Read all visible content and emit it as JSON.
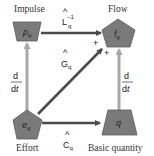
{
  "nodes": {
    "impulse": {
      "label": "Impulse",
      "symbol": "p",
      "subscript": "q",
      "shape": "trapezoid"
    },
    "flow": {
      "label": "Flow",
      "symbol": "f",
      "subscript": "q",
      "shape": "pentagon"
    },
    "effort": {
      "label": "Effort",
      "symbol": "e",
      "subscript": "q",
      "shape": "pentagon"
    },
    "basic_quantity": {
      "label": "Basic quantity",
      "symbol": "q",
      "subscript": "",
      "shape": "trapezoid"
    }
  },
  "edges": {
    "impulse_to_flow": {
      "operator": "L",
      "hat": "^",
      "subscript": "q",
      "superscript": "−1"
    },
    "effort_to_flow": {
      "operator": "G",
      "hat": "^",
      "subscript": "q"
    },
    "effort_to_basic": {
      "operator": "C",
      "hat": "^",
      "subscript": "q"
    },
    "effort_to_impulse": {
      "numerator": "d",
      "denominator": "dt"
    },
    "basic_to_flow": {
      "numerator": "d",
      "denominator": "dt"
    }
  },
  "signs": {
    "plus1": "+",
    "plus2": "+"
  },
  "colors": {
    "node_fill": "#7a7a7a",
    "node_stroke": "#5a5a5a",
    "dark_arrow": "#4a4a4a",
    "light_arrow": "#a8a8a8",
    "text": "#333333"
  }
}
